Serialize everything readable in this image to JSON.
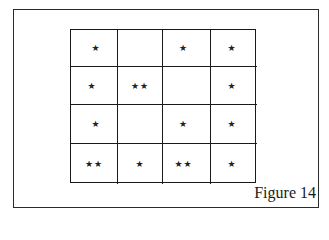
{
  "figure": {
    "caption": "Figure 14",
    "grid": {
      "rows": 4,
      "columns": 4,
      "cells": [
        [
          "*",
          "",
          "*",
          "*"
        ],
        [
          "*",
          "**",
          "",
          "*"
        ],
        [
          "*",
          "",
          "*",
          "*"
        ],
        [
          "**",
          "*",
          "**",
          "*"
        ]
      ]
    },
    "colors": {
      "background": "#ffffff",
      "lines": "#1a1a1a",
      "stars": "#222222"
    }
  }
}
